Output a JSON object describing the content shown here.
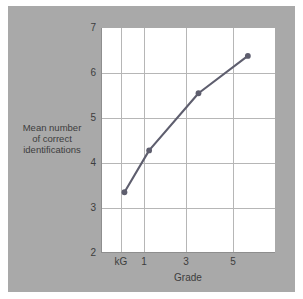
{
  "figure": {
    "background_color": "#a9a9a9",
    "plot_background_color": "#ffffff",
    "grid_color": "#b6b6b6",
    "series_color": "#5e5e6e"
  },
  "chart_data": {
    "type": "line",
    "title": "",
    "xlabel": "Grade",
    "ylabel": "Mean number of correct identifications",
    "ylabel_lines": [
      "Mean number",
      "of correct",
      "identifications"
    ],
    "categories": [
      "kG",
      "1",
      "3",
      "5"
    ],
    "x": [
      0,
      1,
      3,
      5
    ],
    "values": [
      3.35,
      4.28,
      5.55,
      6.38
    ],
    "series": [
      {
        "name": "Mean number of correct identifications",
        "values": [
          3.35,
          4.28,
          5.55,
          6.38
        ]
      }
    ],
    "ylim": [
      2,
      7
    ],
    "xlim": [
      -0.95,
      6.1
    ],
    "yticks": [
      2,
      3,
      4,
      5,
      6,
      7
    ],
    "ytick_labels": [
      "2",
      "3",
      "4",
      "5",
      "6",
      "7"
    ],
    "xticks": [
      0,
      1,
      3,
      5
    ],
    "xtick_labels": [
      "kG",
      "1",
      "3",
      "5"
    ],
    "grid": true,
    "legend": "none",
    "marker": "circle",
    "marker_color": "#5e5e6e",
    "line_color": "#5e5e6e"
  }
}
